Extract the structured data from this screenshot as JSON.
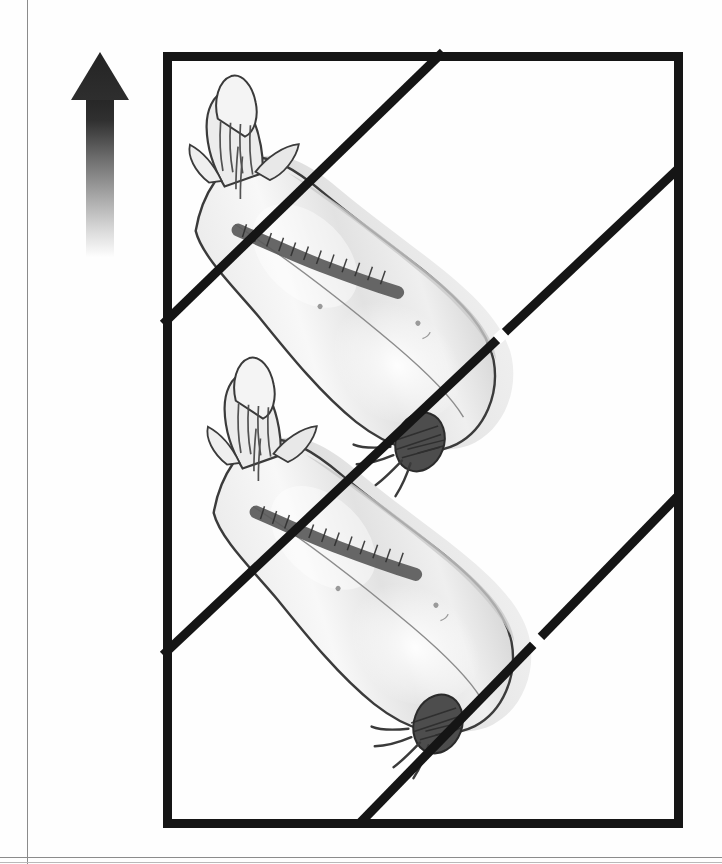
{
  "document": {
    "title": "Carcass splitting / orientation plate",
    "figure_caption": "",
    "page_background": "#ffffff",
    "ink_color": "#1a1a1a",
    "rule_color": "#8b8b8b"
  },
  "page_rules": {
    "left_rule": {
      "name": "left-margin-rule",
      "x": 27,
      "color": "#8b8b8b"
    },
    "bottom_rule": {
      "name": "bottom-margin-rule",
      "y": 857,
      "color": "#8b8b8b"
    },
    "bottom_rule_secondary": {
      "name": "bottom-margin-rule-secondary",
      "y": 862,
      "color": "#b9b9b9"
    }
  },
  "arrow": {
    "name": "orientation-arrow",
    "direction": "up",
    "label": "",
    "x": 70,
    "y": 50,
    "width": 60,
    "height": 210,
    "head_color": "#2b2b2b",
    "shaft_gradient_from": "#2f2f2f",
    "shaft_gradient_to": "#ffffff",
    "semantic": "arrow-up-icon"
  },
  "frame": {
    "name": "illustration-frame",
    "x": 163,
    "y": 52,
    "width": 520,
    "height": 776,
    "border_width": 9,
    "border_color": "#151515",
    "fill": "#ffffff"
  },
  "divider_lines": [
    {
      "name": "divider-line-1",
      "from": {
        "x": 280,
        "y": 0
      },
      "to": {
        "x": 0,
        "y": 272
      },
      "thickness": 9,
      "color": "#151515",
      "break_mark": null
    },
    {
      "name": "divider-line-2",
      "from": {
        "x": 516,
        "y": 116
      },
      "to": {
        "x": 0,
        "y": 603
      },
      "thickness": 9,
      "color": "#151515",
      "break_mark": {
        "t": 0.345,
        "length": 11
      }
    },
    {
      "name": "divider-line-3",
      "from": {
        "x": 514,
        "y": 445
      },
      "to": {
        "x": 196,
        "y": 772
      },
      "thickness": 9,
      "color": "#151515",
      "break_mark": {
        "t": 0.44,
        "length": 11
      }
    }
  ],
  "carcasses": [
    {
      "name": "carcass-upper",
      "label": "",
      "x": 6,
      "y": 18,
      "rotation_deg": -46,
      "flesh_color": "#e3e3e3",
      "flesh_highlight": "#f7f7f7",
      "outline_color": "#3a3a3a",
      "shadow_color": "#c9c9c9",
      "hoof_color": "#4a4a4a",
      "spine_color": "#5a5a5a"
    },
    {
      "name": "carcass-lower",
      "label": "",
      "x": 24,
      "y": 300,
      "rotation_deg": -46,
      "flesh_color": "#e3e3e3",
      "flesh_highlight": "#f7f7f7",
      "outline_color": "#3a3a3a",
      "shadow_color": "#c9c9c9",
      "hoof_color": "#4a4a4a",
      "spine_color": "#5a5a5a"
    }
  ]
}
